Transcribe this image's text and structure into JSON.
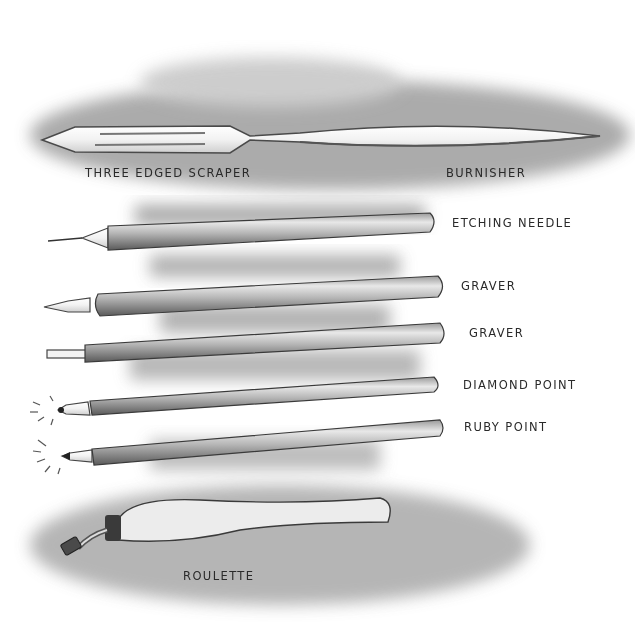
{
  "illustration": {
    "subject": "Etching and engraving tools",
    "style": "pencil drawing, grayscale"
  },
  "labels": {
    "scraper": "THREE EDGED SCRAPER",
    "burnisher": "BURNISHER",
    "etching_needle": "ETCHING NEEDLE",
    "graver_1": "GRAVER",
    "graver_2": "GRAVER",
    "diamond_point": "DIAMOND POINT",
    "ruby_point": "RUBY POINT",
    "roulette": "ROULETTE"
  },
  "colors": {
    "background": "#ffffff",
    "ink": "#2a2a2a",
    "shade_dark": "#6e6e6e",
    "shade_light": "#c8c8c8"
  }
}
